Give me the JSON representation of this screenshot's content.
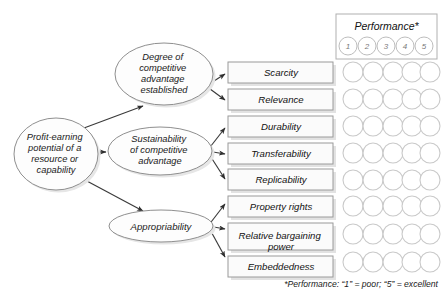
{
  "diagram": {
    "title_hidden": "",
    "root_node": {
      "id": "profit-earning-potential",
      "lines": [
        "Profit-earning",
        "potential of a",
        "resource or",
        "capability"
      ]
    },
    "branch_nodes": [
      {
        "id": "degree-of-competitive-advantage-established",
        "lines": [
          "Degree of",
          "competitive",
          "advantage",
          "established"
        ]
      },
      {
        "id": "sustainability-of-competitive-advantage",
        "lines": [
          "Sustainability",
          "of competitive",
          "advantage"
        ]
      },
      {
        "id": "appropriability",
        "lines": [
          "Appropriability"
        ]
      }
    ],
    "criteria_boxes": [
      {
        "id": "scarcity",
        "lines": [
          "Scarcity"
        ],
        "parent": "degree-of-competitive-advantage-established"
      },
      {
        "id": "relevance",
        "lines": [
          "Relevance"
        ],
        "parent": "degree-of-competitive-advantage-established"
      },
      {
        "id": "durability",
        "lines": [
          "Durability"
        ],
        "parent": "sustainability-of-competitive-advantage"
      },
      {
        "id": "transferability",
        "lines": [
          "Transferability"
        ],
        "parent": "sustainability-of-competitive-advantage"
      },
      {
        "id": "replicability",
        "lines": [
          "Replicability"
        ],
        "parent": "sustainability-of-competitive-advantage"
      },
      {
        "id": "property-rights",
        "lines": [
          "Property rights"
        ],
        "parent": "appropriability"
      },
      {
        "id": "relative-bargaining-power",
        "lines": [
          "Relative bargaining",
          "power"
        ],
        "parent": "appropriability"
      },
      {
        "id": "embeddedness",
        "lines": [
          "Embeddedness"
        ],
        "parent": "appropriability"
      }
    ]
  },
  "performance": {
    "header_label": "Performance*",
    "scale": [
      "1",
      "2",
      "3",
      "4",
      "5"
    ],
    "rating_rows": 8,
    "footnote": "*Performance: “1” = poor; “5” = excellent"
  },
  "colors": {
    "background": "#ffffff",
    "shape_stroke": "#8f8f8f",
    "box_stroke": "#9a9a9a",
    "circle_stroke": "#c9c9c9",
    "connector": "#3a3a3a",
    "text": "#111111",
    "shadow": "#e2e2e2"
  }
}
